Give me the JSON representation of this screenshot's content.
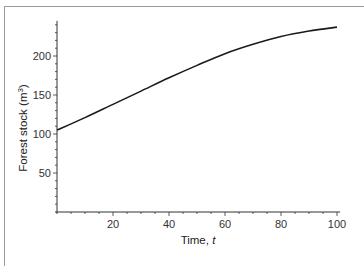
{
  "chart_data": {
    "type": "line",
    "title": "",
    "xlabel": "Time, t",
    "ylabel": "Forest stock (m³)",
    "xlim": [
      0,
      100
    ],
    "ylim": [
      0,
      250
    ],
    "x_ticks": [
      20,
      40,
      60,
      80,
      100
    ],
    "y_ticks": [
      50,
      100,
      150,
      200
    ],
    "grid": false,
    "legend": null,
    "series": [
      {
        "name": "Forest stock",
        "x": [
          0,
          10,
          20,
          30,
          40,
          50,
          60,
          70,
          80,
          90,
          100
        ],
        "values": [
          105,
          121,
          138,
          155,
          172,
          188,
          203,
          215,
          225,
          232,
          237
        ]
      }
    ]
  },
  "labels": {
    "xlabel_main": "Time, ",
    "xlabel_var": "t",
    "ylabel_main": "Forest stock (m",
    "ylabel_sup": "3",
    "ylabel_end": ")"
  }
}
